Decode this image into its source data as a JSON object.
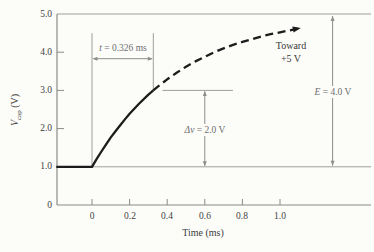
{
  "figure": {
    "background": "#fcfcf9",
    "axis_color": "#8a8a8a",
    "annotation_color": "#8d8d8d",
    "thin_line_color": "#9e9e9e",
    "curve_color": "#1c1c1c"
  },
  "chart_data": {
    "type": "line",
    "title": "",
    "xlabel": "Time (ms)",
    "ylabel": "V_cap (V)",
    "ylabel_parts": {
      "symbol": "V",
      "sub": "cap",
      "unit": " (V)"
    },
    "xlim": [
      -0.19,
      1.48
    ],
    "ylim": [
      0,
      5.0
    ],
    "grid": false,
    "legend": false,
    "x_ticks": [
      "0",
      "0.2",
      "0.4",
      "0.6",
      "0.8",
      "1.0"
    ],
    "x_tick_values": [
      0,
      0.2,
      0.4,
      0.6,
      0.8,
      1.0
    ],
    "y_ticks": [
      "0",
      "1.0",
      "2.0",
      "3.0",
      "4.0",
      "5.0"
    ],
    "y_tick_values": [
      0,
      1,
      2,
      3,
      4,
      5
    ],
    "series": [
      {
        "name": "v-cap-measured",
        "style": "solid",
        "x": [
          -0.19,
          0,
          0.025,
          0.05,
          0.075,
          0.1,
          0.125,
          0.15,
          0.175,
          0.2,
          0.25,
          0.3,
          0.326
        ],
        "y": [
          1.0,
          1.0,
          1.21,
          1.4,
          1.59,
          1.77,
          1.93,
          2.09,
          2.24,
          2.39,
          2.65,
          2.89,
          3.0
        ]
      },
      {
        "name": "v-cap-projected",
        "style": "dashed",
        "arrow_end": true,
        "x": [
          0.326,
          0.35,
          0.4,
          0.45,
          0.5,
          0.55,
          0.6,
          0.65,
          0.7,
          0.75,
          0.8,
          0.85,
          0.9,
          0.95,
          1.0,
          1.05,
          1.1
        ],
        "y": [
          3.0,
          3.1,
          3.29,
          3.46,
          3.62,
          3.76,
          3.88,
          4.0,
          4.1,
          4.19,
          4.27,
          4.34,
          4.41,
          4.47,
          4.52,
          4.57,
          4.62
        ]
      }
    ],
    "reference_lines": [
      {
        "name": "supply-5v-line",
        "v": 5.0,
        "t_from": -0.186,
        "t_to": 1.484
      },
      {
        "name": "initial-1v-line",
        "v": 1.0,
        "t_from": 0,
        "t_to": 1.484
      },
      {
        "name": "level-3v-line",
        "v": 3.0,
        "t_from": 0.375,
        "t_to": 0.75
      }
    ],
    "guides": [
      {
        "name": "t0-guide-line",
        "t": 0,
        "v_from": 4.5,
        "v_to": 1.0
      },
      {
        "name": "t0326-guide-line",
        "t": 0.326,
        "v_from": 4.5,
        "v_to": 3.0
      }
    ],
    "annotations": {
      "time_interval": {
        "var": "t",
        "rest": " = 0.326 ms",
        "t_from": 0,
        "t_to": 0.326,
        "v": 3.83
      },
      "toward": {
        "line1": "Toward",
        "line2": "+5 V"
      },
      "delta_v": {
        "var": "Δv",
        "rest": " = 2.0 V",
        "t": 0.6,
        "v_from": 3.0,
        "v_to": 1.0
      },
      "source_e": {
        "var": "E",
        "rest": " = 4.0 V",
        "t": 1.28,
        "v_from": 5.0,
        "v_to": 1.0
      }
    }
  }
}
